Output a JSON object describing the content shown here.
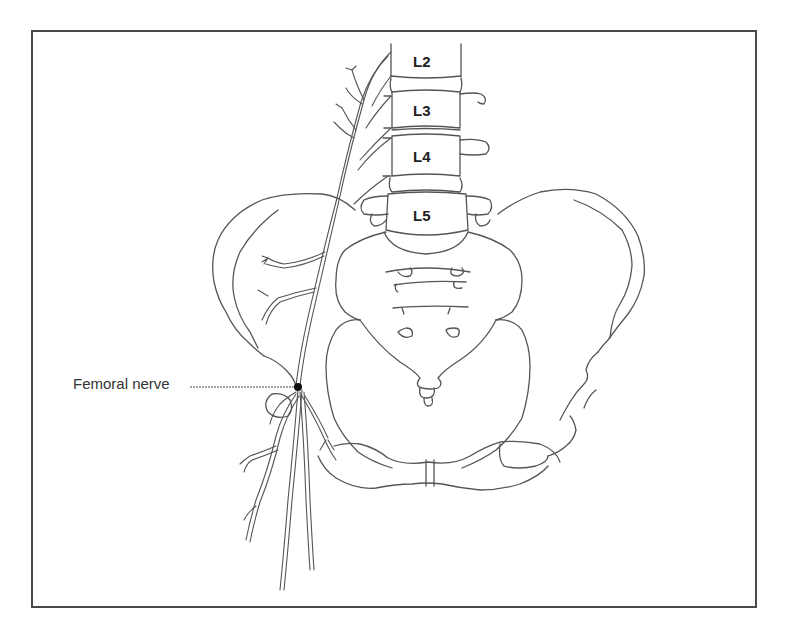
{
  "figure": {
    "type": "anatomical line drawing",
    "vertebrae": [
      {
        "label": "L2",
        "x": 413,
        "y": 53
      },
      {
        "label": "L3",
        "x": 413,
        "y": 102
      },
      {
        "label": "L4",
        "x": 413,
        "y": 148
      },
      {
        "label": "L5",
        "x": 413,
        "y": 207
      }
    ],
    "annotation": {
      "label": "Femoral nerve",
      "pointer_end": {
        "x": 298,
        "y": 387
      },
      "marker": "filled dot"
    },
    "colors": {
      "line": "#555555",
      "frame": "#4a4a4a",
      "background": "#ffffff",
      "text": "#222222"
    }
  }
}
